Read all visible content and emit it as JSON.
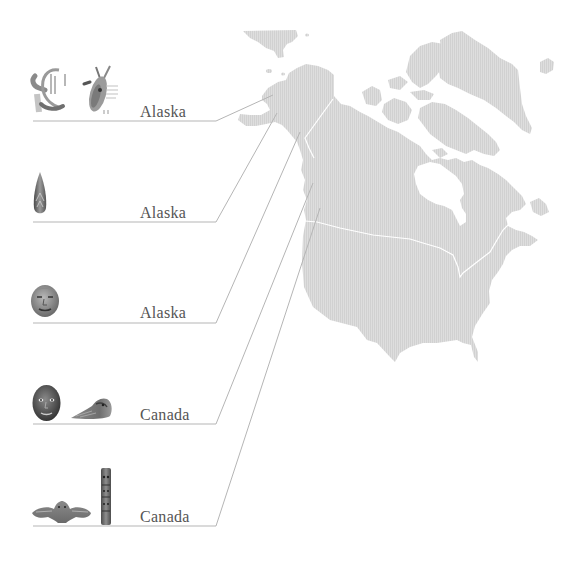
{
  "colors": {
    "background": "#ffffff",
    "land": "#dadada",
    "land_stripe": "#d0d0d0",
    "border_lines": "#ffffff",
    "connector": "#b5b5b5",
    "label_text": "#555555"
  },
  "map": {
    "type": "choropleth-outline",
    "regions_shown": [
      "alaska",
      "canada",
      "usa",
      "greenland",
      "iceland",
      "chukotka"
    ],
    "borders_shown": [
      "alaska-canada",
      "usa-canada"
    ]
  },
  "entries": [
    {
      "label": "Alaska",
      "artifacts": [
        {
          "name": "carved-hook-icon"
        },
        {
          "name": "bird-figure-icon"
        }
      ],
      "connector": {
        "underline_y": 121,
        "map_point": [
          273,
          95
        ]
      }
    },
    {
      "label": "Alaska",
      "artifacts": [
        {
          "name": "teardrop-pendant-icon"
        }
      ],
      "connector": {
        "underline_y": 222,
        "map_point": [
          277,
          113
        ]
      }
    },
    {
      "label": "Alaska",
      "artifacts": [
        {
          "name": "carved-mask-icon"
        }
      ],
      "connector": {
        "underline_y": 323,
        "map_point": [
          300,
          132
        ]
      }
    },
    {
      "label": "Canada",
      "artifacts": [
        {
          "name": "dark-mask-icon"
        },
        {
          "name": "raven-rattle-icon"
        }
      ],
      "connector": {
        "underline_y": 424,
        "map_point": [
          313,
          183
        ]
      }
    },
    {
      "label": "Canada",
      "artifacts": [
        {
          "name": "bird-spread-wings-icon"
        },
        {
          "name": "totem-pole-icon"
        }
      ],
      "connector": {
        "underline_y": 526,
        "map_point": [
          320,
          208
        ]
      }
    }
  ]
}
